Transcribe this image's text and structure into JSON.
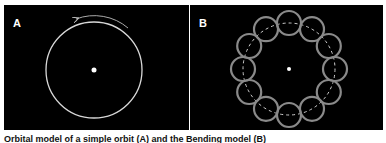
{
  "panels": [
    {
      "label": "A",
      "description": "Single circular orbit with central point and counterclockwise arrow"
    },
    {
      "label": "B",
      "description": "Twelve small circles arranged on a dashed circular path around a central point"
    }
  ],
  "caption": "Orbital model of a simple orbit (A) and the Bending model (B)",
  "colors": {
    "background": "#000000",
    "stroke": "#d8d8d8",
    "ring_stroke": "#8a8a8a"
  }
}
